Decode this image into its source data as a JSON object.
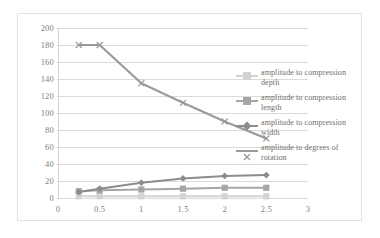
{
  "chart_data": {
    "type": "line",
    "title": "",
    "xlabel": "",
    "ylabel": "",
    "xlim": [
      0,
      3
    ],
    "ylim": [
      0,
      200
    ],
    "grid": true,
    "legend_position": "right",
    "x_ticks": [
      "0",
      "0.5",
      "1",
      "1.5",
      "2",
      "2.5",
      "3"
    ],
    "x_tick_values": [
      0,
      0.5,
      1,
      1.5,
      2,
      2.5,
      3
    ],
    "y_ticks": [
      "0",
      "20",
      "40",
      "60",
      "80",
      "100",
      "120",
      "140",
      "160",
      "180",
      "200"
    ],
    "y_tick_values": [
      0,
      20,
      40,
      60,
      80,
      100,
      120,
      140,
      160,
      180,
      200
    ],
    "x": [
      0.25,
      0.5,
      1,
      1.5,
      2,
      2.5
    ],
    "series": [
      {
        "name": "amplitude to compression depth",
        "values": [
          2,
          2,
          2,
          2,
          2,
          2
        ],
        "color": "#d3d3d3"
      },
      {
        "name": "amplitude to compression length",
        "values": [
          8,
          9,
          10,
          11,
          12,
          12
        ],
        "color": "#a6a6a6"
      },
      {
        "name": "amplitude to compression width",
        "values": [
          7,
          11,
          18,
          23,
          26,
          27
        ],
        "color": "#8c8c8c"
      },
      {
        "name": "amplitude to degrees of rotation",
        "values": [
          180,
          180,
          135,
          112,
          90,
          70
        ],
        "color": "#9a9a9a"
      }
    ]
  },
  "legend": {
    "entries": [
      {
        "label": "amplitude to compression depth"
      },
      {
        "label": "amplitude to compression length"
      },
      {
        "label": "amplitude to compression width"
      },
      {
        "label": "amplitude to degrees of rotation"
      }
    ]
  }
}
